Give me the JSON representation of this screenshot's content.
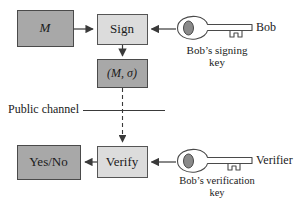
{
  "figure": {
    "type": "flow-diagram",
    "background_color": "#ffffff",
    "colors": {
      "data_box_fill": "#a8a8a8",
      "process_box_fill": "#dcdcdc",
      "box_stroke": "#4a4a4a",
      "arrow": "#3a3a3a",
      "key_fill": "#ffffff",
      "key_stroke": "#4a4a4a",
      "key_bow_fill": "#8a8a8a",
      "text": "#1a1a1a"
    }
  },
  "nodes": {
    "message": {
      "label": "M",
      "style": "data-box",
      "italic": true
    },
    "sign": {
      "label": "Sign",
      "style": "process-box",
      "italic": false
    },
    "signed_message": {
      "label": "(M, σ)",
      "style": "data-box",
      "italic": true
    },
    "verify": {
      "label": "Verify",
      "style": "process-box",
      "italic": false
    },
    "result": {
      "label": "Yes/No",
      "style": "data-box",
      "italic": false
    }
  },
  "keys": {
    "signing": {
      "caption_line1": "Bob’s signing",
      "caption_line2": "key",
      "owner_label": "Bob",
      "icon": "key-icon"
    },
    "verification": {
      "caption_line1": "Bob’s verification",
      "caption_line2": "key",
      "owner_label": "Verifier",
      "icon": "key-icon"
    }
  },
  "channel": {
    "label": "Public channel",
    "line_style": "solid-horizontal",
    "transmission_line_style": "dashed-vertical"
  },
  "edges": [
    {
      "from": "message",
      "to": "sign",
      "direction": "right",
      "style": "solid"
    },
    {
      "from": "signing_key",
      "to": "sign",
      "direction": "left",
      "style": "solid"
    },
    {
      "from": "sign",
      "to": "signed_message",
      "direction": "down",
      "style": "solid"
    },
    {
      "from": "signed_message",
      "to": "verify",
      "direction": "down",
      "style": "dashed"
    },
    {
      "from": "verification_key",
      "to": "verify",
      "direction": "left",
      "style": "solid"
    },
    {
      "from": "verify",
      "to": "result",
      "direction": "left",
      "style": "solid"
    }
  ]
}
